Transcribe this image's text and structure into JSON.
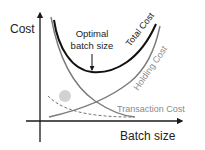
{
  "diagram": {
    "axes": {
      "y_label": "Cost",
      "x_label": "Batch size"
    },
    "annotation": {
      "line1": "Optimal",
      "line2": "batch size"
    },
    "curves": {
      "total": {
        "label": "Total Cost",
        "color": "#111111"
      },
      "holding": {
        "label": "Holding Cost",
        "color": "#7a7a7a"
      },
      "transaction": {
        "label": "Transaction Cost",
        "color": "#7a7a7a"
      },
      "dashed": {
        "style": "dashed",
        "color": "#777777"
      }
    },
    "colors": {
      "axis": "#1a1a1a",
      "ellipse": "#d2d2d2",
      "label_gray": "#8a8a8a",
      "label_dark": "#222222"
    }
  }
}
